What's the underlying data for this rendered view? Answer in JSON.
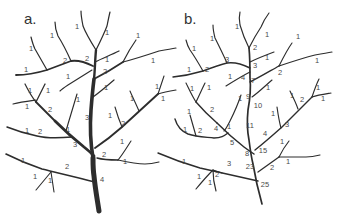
{
  "figure": {
    "background_color": "#ffffff",
    "branch_color": "#2d2d2d",
    "label_color": "#4a4a4a",
    "panels": [
      {
        "id": "a",
        "letter": "a.",
        "letter_x": 24,
        "letter_y": 24,
        "branch_labels": [
          {
            "x": 77,
            "y": 27,
            "t": "1"
          },
          {
            "x": 52,
            "y": 36,
            "t": "1"
          },
          {
            "x": 107,
            "y": 33,
            "t": "1"
          },
          {
            "x": 138,
            "y": 36,
            "t": "1"
          },
          {
            "x": 31,
            "y": 49,
            "t": "1"
          },
          {
            "x": 65,
            "y": 61,
            "t": "2"
          },
          {
            "x": 87,
            "y": 59,
            "t": "2"
          },
          {
            "x": 107,
            "y": 60,
            "t": "1"
          },
          {
            "x": 153,
            "y": 61,
            "t": "1"
          },
          {
            "x": 26,
            "y": 70,
            "t": "1"
          },
          {
            "x": 105,
            "y": 72,
            "t": "2"
          },
          {
            "x": 68,
            "y": 77,
            "t": "1"
          },
          {
            "x": 106,
            "y": 88,
            "t": "1"
          },
          {
            "x": 157,
            "y": 87,
            "t": "1"
          },
          {
            "x": 30,
            "y": 91,
            "t": "1"
          },
          {
            "x": 48,
            "y": 91,
            "t": "1"
          },
          {
            "x": 78,
            "y": 100,
            "t": "1"
          },
          {
            "x": 132,
            "y": 99,
            "t": "1"
          },
          {
            "x": 163,
            "y": 99,
            "t": "1"
          },
          {
            "x": 27,
            "y": 107,
            "t": "1"
          },
          {
            "x": 50,
            "y": 110,
            "t": "2"
          },
          {
            "x": 87,
            "y": 118,
            "t": "3"
          },
          {
            "x": 110,
            "y": 116,
            "t": "1"
          },
          {
            "x": 123,
            "y": 124,
            "t": "2"
          },
          {
            "x": 27,
            "y": 131,
            "t": "1"
          },
          {
            "x": 40,
            "y": 132,
            "t": "2"
          },
          {
            "x": 68,
            "y": 130,
            "t": "1"
          },
          {
            "x": 75,
            "y": 145,
            "t": "3"
          },
          {
            "x": 122,
            "y": 142,
            "t": "1"
          },
          {
            "x": 104,
            "y": 155,
            "t": "2"
          },
          {
            "x": 23,
            "y": 161,
            "t": "1"
          },
          {
            "x": 125,
            "y": 162,
            "t": "1"
          },
          {
            "x": 67,
            "y": 167,
            "t": "2"
          },
          {
            "x": 35,
            "y": 177,
            "t": "1"
          },
          {
            "x": 50,
            "y": 181,
            "t": "1"
          },
          {
            "x": 102,
            "y": 180,
            "t": "4"
          }
        ]
      },
      {
        "id": "b",
        "letter": "b.",
        "letter_x": 184,
        "letter_y": 24,
        "branch_labels": [
          {
            "x": 237,
            "y": 27,
            "t": "1"
          },
          {
            "x": 267,
            "y": 35,
            "t": "1"
          },
          {
            "x": 212,
            "y": 39,
            "t": "1"
          },
          {
            "x": 298,
            "y": 37,
            "t": "1"
          },
          {
            "x": 194,
            "y": 49,
            "t": "1"
          },
          {
            "x": 255,
            "y": 48,
            "t": "2"
          },
          {
            "x": 227,
            "y": 60,
            "t": "3"
          },
          {
            "x": 267,
            "y": 58,
            "t": "1"
          },
          {
            "x": 317,
            "y": 61,
            "t": "1"
          },
          {
            "x": 189,
            "y": 70,
            "t": "1"
          },
          {
            "x": 207,
            "y": 70,
            "t": "2"
          },
          {
            "x": 255,
            "y": 66,
            "t": "3"
          },
          {
            "x": 230,
            "y": 77,
            "t": "1"
          },
          {
            "x": 243,
            "y": 78,
            "t": "4"
          },
          {
            "x": 253,
            "y": 81,
            "t": "7"
          },
          {
            "x": 280,
            "y": 73,
            "t": "2"
          },
          {
            "x": 268,
            "y": 88,
            "t": "1"
          },
          {
            "x": 248,
            "y": 97,
            "t": "9"
          },
          {
            "x": 192,
            "y": 89,
            "t": "1"
          },
          {
            "x": 209,
            "y": 88,
            "t": "1"
          },
          {
            "x": 240,
            "y": 99,
            "t": "1"
          },
          {
            "x": 258,
            "y": 106,
            "t": "10"
          },
          {
            "x": 318,
            "y": 88,
            "t": "1"
          },
          {
            "x": 292,
            "y": 96,
            "t": "1"
          },
          {
            "x": 302,
            "y": 100,
            "t": "2"
          },
          {
            "x": 323,
            "y": 99,
            "t": "1"
          },
          {
            "x": 212,
            "y": 110,
            "t": "2"
          },
          {
            "x": 189,
            "y": 112,
            "t": "1"
          },
          {
            "x": 273,
            "y": 114,
            "t": "1"
          },
          {
            "x": 250,
            "y": 126,
            "t": "11"
          },
          {
            "x": 185,
            "y": 130,
            "t": "1"
          },
          {
            "x": 200,
            "y": 131,
            "t": "2"
          },
          {
            "x": 216,
            "y": 129,
            "t": "4"
          },
          {
            "x": 229,
            "y": 127,
            "t": "1"
          },
          {
            "x": 265,
            "y": 134,
            "t": "4"
          },
          {
            "x": 287,
            "y": 125,
            "t": "3"
          },
          {
            "x": 232,
            "y": 143,
            "t": "5"
          },
          {
            "x": 282,
            "y": 142,
            "t": "1"
          },
          {
            "x": 247,
            "y": 154,
            "t": "8"
          },
          {
            "x": 263,
            "y": 151,
            "t": "15"
          },
          {
            "x": 184,
            "y": 162,
            "t": "1"
          },
          {
            "x": 229,
            "y": 164,
            "t": "3"
          },
          {
            "x": 250,
            "y": 167,
            "t": "23"
          },
          {
            "x": 272,
            "y": 168,
            "t": "2"
          },
          {
            "x": 288,
            "y": 162,
            "t": "1"
          },
          {
            "x": 199,
            "y": 177,
            "t": "1"
          },
          {
            "x": 217,
            "y": 175,
            "t": "2"
          },
          {
            "x": 210,
            "y": 183,
            "t": "1"
          },
          {
            "x": 265,
            "y": 185,
            "t": "25"
          }
        ]
      }
    ]
  }
}
